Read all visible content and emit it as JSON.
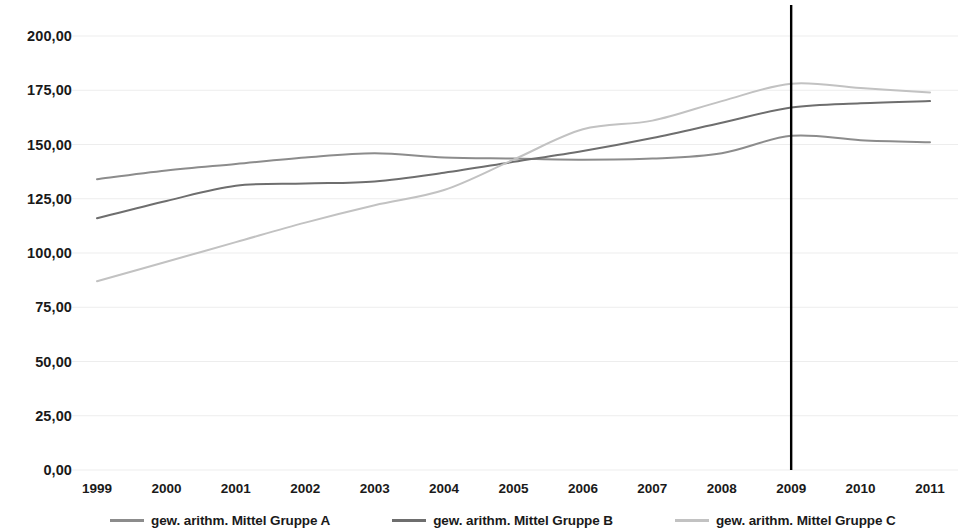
{
  "chart_data": {
    "type": "line",
    "title": "",
    "subtitle": "",
    "xlabel": "",
    "ylabel": "",
    "categories": [
      "1999",
      "2000",
      "2001",
      "2002",
      "2003",
      "2004",
      "2005",
      "2006",
      "2007",
      "2008",
      "2009",
      "2010",
      "2011"
    ],
    "ylim": [
      0,
      200
    ],
    "y_ticks": [
      "0,00",
      "25,00",
      "50,00",
      "75,00",
      "100,00",
      "125,00",
      "150,00",
      "175,00",
      "200,00"
    ],
    "y_tick_values": [
      0,
      25,
      50,
      75,
      100,
      125,
      150,
      175,
      200
    ],
    "grid": true,
    "grid_axis": "y",
    "legend_position": "bottom",
    "series": [
      {
        "name": "gew. arithm. Mittel Gruppe A",
        "color": "#8c8c8c",
        "values": [
          134,
          138,
          141,
          144,
          146,
          144,
          143.5,
          143,
          143.5,
          146,
          154,
          152,
          151
        ]
      },
      {
        "name": "gew. arithm. Mittel Gruppe B",
        "color": "#6e6e6e",
        "values": [
          116,
          124,
          131,
          132,
          133,
          137,
          142,
          147,
          153,
          160,
          167,
          169,
          170
        ]
      },
      {
        "name": "gew. arithm. Mittel Gruppe C",
        "color": "#c2c2c2",
        "values": [
          87,
          96,
          105,
          114,
          122,
          129,
          143,
          157,
          161,
          170,
          178,
          176,
          174
        ]
      }
    ],
    "annotations": [
      {
        "type": "vertical-line",
        "name": "reference-line-2009",
        "at_category": "2009",
        "color": "#000000"
      }
    ]
  },
  "legend": {
    "items": [
      {
        "label": "gew. arithm. Mittel Gruppe A",
        "color": "#8c8c8c"
      },
      {
        "label": "gew. arithm. Mittel Gruppe B",
        "color": "#6e6e6e"
      },
      {
        "label": "gew. arithm. Mittel Gruppe C",
        "color": "#c2c2c2"
      }
    ]
  }
}
